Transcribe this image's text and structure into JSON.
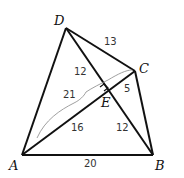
{
  "diagram": {
    "points": {
      "A": {
        "label": "A",
        "x": 22,
        "y": 155
      },
      "B": {
        "label": "B",
        "x": 153,
        "y": 155
      },
      "C": {
        "label": "C",
        "x": 135,
        "y": 71
      },
      "D": {
        "label": "D",
        "x": 66,
        "y": 28
      },
      "E": {
        "label": "E",
        "x": 106,
        "y": 91
      }
    },
    "segment_labels": {
      "DC": "13",
      "DE": "12",
      "EC": "5",
      "AE": "16",
      "EB": "12",
      "AB": "20",
      "AC_brace": "21"
    },
    "annotations": {
      "right_angle_at": "E"
    }
  }
}
